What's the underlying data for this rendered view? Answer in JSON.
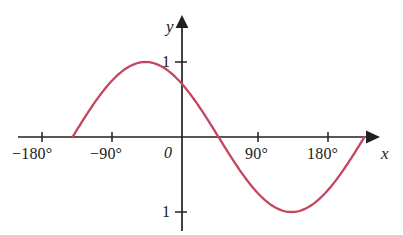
{
  "chart_data": {
    "type": "line",
    "title": "",
    "subtitle": "",
    "xlabel": "x",
    "ylabel": "y",
    "xlim": [
      -225,
      225
    ],
    "ylim": [
      -1.45,
      1.45
    ],
    "grid": false,
    "legend": false,
    "x_unit": "degrees",
    "curve_color": "#c4455e",
    "axis_color": "#231f20",
    "background_color": "#ffffff",
    "x_tick_values": [
      -180,
      -90,
      0,
      90,
      180
    ],
    "x_tick_labels": [
      "−180°",
      "−90°",
      "0",
      "90°",
      "180°"
    ],
    "y_tick_values": [
      1,
      -1
    ],
    "y_tick_labels": [
      "1",
      "1"
    ],
    "origin_label": "0",
    "equation": "y = sin(x + 135°)",
    "amplitude": 1,
    "period": 360,
    "phase_shift": 135,
    "domain_drawn": [
      -135,
      225
    ],
    "zero_crossings": [
      -135,
      45,
      225
    ],
    "maximum": {
      "x": 135,
      "y": 1
    },
    "minimum": {
      "x": -45,
      "y": -1
    },
    "series": [
      {
        "name": "y = sin(x + 135°)",
        "x": [
          -135,
          -120,
          -105,
          -90,
          -75,
          -60,
          -45,
          -30,
          -15,
          0,
          15,
          30,
          45,
          60,
          75,
          90,
          105,
          120,
          135,
          150,
          165,
          180,
          195,
          210,
          225
        ],
        "values": [
          0,
          -0.259,
          -0.5,
          -0.707,
          -0.866,
          -0.966,
          -1,
          -0.966,
          -0.866,
          -0.707,
          -0.5,
          -0.259,
          0,
          0.259,
          0.5,
          0.707,
          0.866,
          0.966,
          1,
          0.966,
          0.866,
          0.707,
          0.5,
          0.259,
          0
        ]
      }
    ]
  },
  "labels": {
    "x_neg180": "−180°",
    "x_neg90": "−90°",
    "x_pos90": "90°",
    "x_pos180": "180°",
    "origin": "0",
    "y_top": "1",
    "y_bottom": "1",
    "x_axis_name": "x",
    "y_axis_name": "y"
  }
}
